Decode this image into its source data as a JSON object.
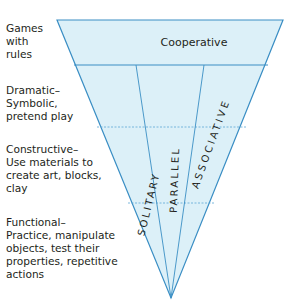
{
  "diagram": {
    "type": "inverted-triangle",
    "colors": {
      "fill": "#dcf0f8",
      "stroke": "#3a8ec4",
      "text": "#231f20"
    },
    "play_types": [
      {
        "id": "games",
        "label": "Games\nwith\nrules"
      },
      {
        "id": "dramatic",
        "label": "Dramatic–\nSymbolic,\npretend play"
      },
      {
        "id": "constructive",
        "label": "Constructive–\nUse materials to\ncreate art, blocks,\nclay"
      },
      {
        "id": "functional",
        "label": "Functional–\nPractice, manipulate\nobjects, test their\nproperties, repetitive\nactions"
      }
    ],
    "social_stages": {
      "cooperative": "Cooperative",
      "solitary": "SOLITARY",
      "parallel": "PARALLEL",
      "associative": "ASSOCIATIVE"
    }
  }
}
